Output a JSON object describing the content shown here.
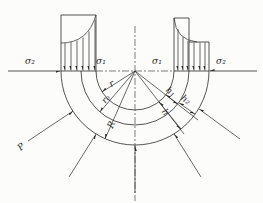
{
  "figure": {
    "labels": {
      "sigma2_left": "σ₂",
      "sigma1_left": "σ₁",
      "sigma1_right": "σ₁",
      "sigma2_right": "σ₂",
      "radius_inner": "r",
      "radius_neutral": "r₀",
      "radius_outer": "R",
      "thickness_inner": "h₁",
      "thickness_outer": "h₂",
      "thickness_total": "h",
      "load": "P"
    },
    "colors": {
      "line": "#2a2a2a",
      "background": "#fcfcfb"
    }
  }
}
